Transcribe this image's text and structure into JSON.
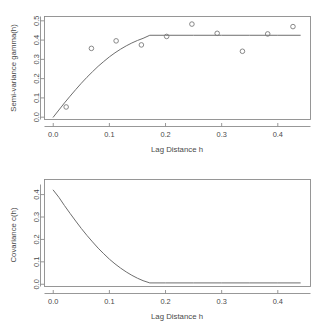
{
  "figure": {
    "background": "#ffffff",
    "axis_color": "#8c8c8c",
    "curve_color": "#6e6e6e",
    "point_color": "#7a7a7a",
    "text_color": "#4a4a4a"
  },
  "panels": {
    "top": {
      "name": "semi-variance-variogram-plot",
      "xlabel": "Lag Distance h",
      "ylabel": "Semi-variance gamma(h)",
      "xticks": [
        "0.0",
        "0.1",
        "0.2",
        "0.3",
        "0.4"
      ],
      "yticks": [
        "0.0",
        "0.1",
        "0.2",
        "0.3",
        "0.4",
        "0.5"
      ]
    },
    "bottom": {
      "name": "covariance-plot",
      "xlabel": "Lag Distance h",
      "ylabel": "Covariance c(h)",
      "xticks": [
        "0.0",
        "0.1",
        "0.2",
        "0.3",
        "0.4"
      ],
      "yticks": [
        "0.0",
        "0.1",
        "0.2",
        "0.3",
        "0.4"
      ]
    }
  },
  "chart_data": [
    {
      "type": "scatter",
      "id": "semivariogram",
      "title": "",
      "xlabel": "Lag Distance h",
      "ylabel": "Semi-variance gamma(h)",
      "xlim": [
        -0.012,
        0.452
      ],
      "ylim": [
        -0.012,
        0.512
      ],
      "xticks": [
        0.0,
        0.1,
        0.2,
        0.3,
        0.4
      ],
      "yticks": [
        0.0,
        0.1,
        0.2,
        0.3,
        0.4,
        0.5
      ],
      "grid": false,
      "legend": null,
      "series": [
        {
          "name": "Empirical semi-variance",
          "marker": "open-circle",
          "x": [
            0.023,
            0.068,
            0.112,
            0.157,
            0.202,
            0.247,
            0.292,
            0.337,
            0.382,
            0.427
          ],
          "y": [
            0.053,
            0.357,
            0.396,
            0.375,
            0.419,
            0.483,
            0.435,
            0.342,
            0.432,
            0.47
          ]
        },
        {
          "name": "Fitted spherical model",
          "marker": "line",
          "model": "spherical",
          "nugget": 0.0,
          "sill": 0.425,
          "range": 0.172,
          "x": [
            0.0,
            0.01,
            0.02,
            0.03,
            0.04,
            0.05,
            0.06,
            0.07,
            0.08,
            0.09,
            0.1,
            0.11,
            0.12,
            0.13,
            0.14,
            0.15,
            0.16,
            0.172,
            0.2,
            0.25,
            0.3,
            0.35,
            0.4,
            0.44
          ],
          "y": [
            0.0,
            0.037,
            0.074,
            0.109,
            0.143,
            0.176,
            0.207,
            0.236,
            0.264,
            0.289,
            0.313,
            0.334,
            0.353,
            0.37,
            0.385,
            0.398,
            0.409,
            0.425,
            0.425,
            0.425,
            0.425,
            0.425,
            0.425,
            0.425
          ]
        }
      ]
    },
    {
      "type": "line",
      "id": "covariance",
      "title": "",
      "xlabel": "Lag Distance h",
      "ylabel": "Covariance c(h)",
      "xlim": [
        -0.012,
        0.452
      ],
      "ylim": [
        -0.01,
        0.445
      ],
      "xticks": [
        0.0,
        0.1,
        0.2,
        0.3,
        0.4
      ],
      "yticks": [
        0.0,
        0.1,
        0.2,
        0.3,
        0.4
      ],
      "grid": false,
      "legend": null,
      "series": [
        {
          "name": "Covariance c(h)",
          "marker": "line",
          "sill": 0.425,
          "range": 0.172,
          "x": [
            0.0,
            0.01,
            0.02,
            0.03,
            0.04,
            0.05,
            0.06,
            0.07,
            0.08,
            0.09,
            0.1,
            0.11,
            0.12,
            0.13,
            0.14,
            0.15,
            0.16,
            0.172,
            0.2,
            0.25,
            0.3,
            0.35,
            0.4,
            0.44
          ],
          "y": [
            0.42,
            0.388,
            0.351,
            0.316,
            0.282,
            0.249,
            0.218,
            0.189,
            0.161,
            0.136,
            0.112,
            0.091,
            0.072,
            0.055,
            0.04,
            0.027,
            0.016,
            0.006,
            0.006,
            0.006,
            0.006,
            0.006,
            0.006,
            0.006
          ]
        }
      ]
    }
  ]
}
